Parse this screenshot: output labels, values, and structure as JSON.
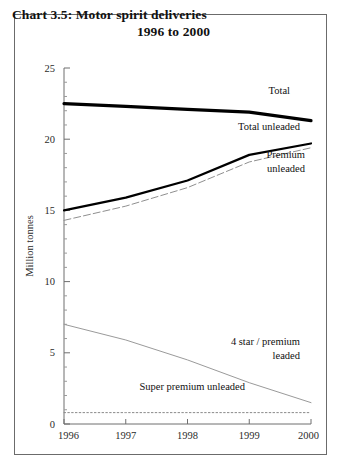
{
  "title": {
    "line1": "Chart 3.5: Motor spirit deliveries",
    "line2": "1996 to 2000"
  },
  "chart_data": {
    "type": "line",
    "title": "Chart 3.5: Motor spirit deliveries 1996 to 2000",
    "xlabel": "",
    "ylabel": "Million tonnes",
    "x": [
      "1996",
      "1997",
      "1998",
      "1999",
      "2000"
    ],
    "xtick_labels": [
      "1996",
      "1997",
      "1998",
      "1999",
      "2000"
    ],
    "ytick_labels": [
      "0",
      "5",
      "10",
      "15",
      "20",
      "25"
    ],
    "ytick_values": [
      0,
      5,
      10,
      15,
      20,
      25
    ],
    "ylim": [
      0,
      25
    ],
    "grid": false,
    "legend_position": "inline-annotations",
    "series": [
      {
        "name": "Total",
        "label": "Total",
        "style": "solid-thick",
        "color": "#000000",
        "values": [
          22.5,
          22.3,
          22.1,
          21.9,
          21.3
        ]
      },
      {
        "name": "Total unleaded",
        "label": "Total unleaded",
        "style": "solid-medium",
        "color": "#000000",
        "values": [
          15.0,
          15.9,
          17.1,
          18.9,
          19.7
        ]
      },
      {
        "name": "Premium unleaded",
        "label": "Premium unleaded",
        "style": "dashed-thin",
        "color": "#8f8f8f",
        "values": [
          14.3,
          15.3,
          16.6,
          18.4,
          19.4
        ]
      },
      {
        "name": "4 star / premium leaded",
        "label": "4 star / premium leaded",
        "style": "solid-thin",
        "color": "#9a9a9a",
        "values": [
          7.0,
          5.9,
          4.5,
          2.9,
          1.5
        ]
      },
      {
        "name": "Super premium unleaded",
        "label": "Super premium unleaded",
        "style": "dotted-thin",
        "color": "#8a8a8a",
        "values": [
          0.8,
          0.8,
          0.8,
          0.8,
          0.8
        ]
      }
    ],
    "annotations": [
      {
        "text": "Total",
        "x": 290,
        "y": 94
      },
      {
        "text": "Total unleaded",
        "x": 300,
        "y": 130
      },
      {
        "text": "Premium",
        "x": 305,
        "y": 158
      },
      {
        "text": "unleaded",
        "x": 305,
        "y": 172
      },
      {
        "text": "4 star / premium",
        "x": 300,
        "y": 345
      },
      {
        "text": "leaded",
        "x": 300,
        "y": 359
      },
      {
        "text": "Super premium unleaded",
        "x": 245,
        "y": 390
      }
    ]
  }
}
